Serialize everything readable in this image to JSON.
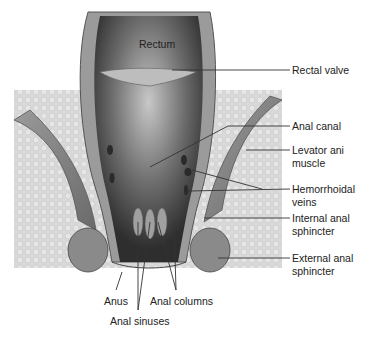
{
  "diagram": {
    "labels": {
      "rectum": "Rectum",
      "rectal_valve": "Rectal valve",
      "anal_canal": "Anal canal",
      "levator_ani_1": "Levator ani",
      "levator_ani_2": "muscle",
      "hemorrhoidal_1": "Hemorrhoidal",
      "hemorrhoidal_2": "veins",
      "internal_1": "Internal anal",
      "internal_2": "sphincter",
      "external_1": "External anal",
      "external_2": "sphincter",
      "anus": "Anus",
      "anal_columns": "Anal columns",
      "anal_sinuses": "Anal sinuses"
    },
    "colors": {
      "background": "#ffffff",
      "fat_tissue": "#d4d4d4",
      "wall": "#8c8c8c",
      "lumen_dark": "#3a3a3a",
      "leader_line": "#333333"
    }
  }
}
